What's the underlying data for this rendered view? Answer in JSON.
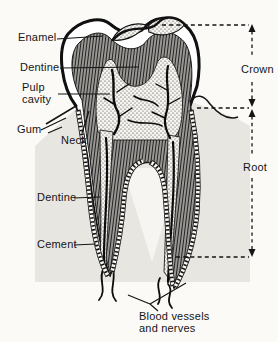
{
  "diagram": {
    "labels": {
      "enamel": "Enamel",
      "dentine_upper": "Dentine",
      "pulp_cavity": "Pulp cavity",
      "gum": "Gum",
      "neck": "Neck",
      "dentine_lower": "Dentine",
      "cement": "Cement",
      "crown": "Crown",
      "root": "Root",
      "blood_vessels": "Blood vessels and nerves"
    },
    "colors": {
      "ink": "#151515",
      "gum_shade": "#e8e6e1",
      "background": "#fbfaf7",
      "pulp_stipple_bg": "#f6f4ef"
    }
  }
}
